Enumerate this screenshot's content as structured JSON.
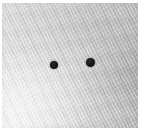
{
  "image": {
    "title": "Photograph of light gray woven fabric with two dark dots",
    "subject": "textured cloth surface",
    "width_px": 144,
    "height_px": 132,
    "orientation": "landscape"
  },
  "surface": {
    "name": "woven fabric",
    "material": "textured cloth",
    "weave_direction": "diagonal, lower-left to upper-right",
    "base_color": "#d6d6d6",
    "light_color": "#ececec",
    "dark_color": "#bababa",
    "lighting": "lighter at bottom-left, darker toward right edge"
  },
  "margins": {
    "top_px": 3,
    "right_px": 6,
    "bottom_px": 4,
    "left_px": 2,
    "color": "#ffffff"
  },
  "markers": [
    {
      "label": "left dot",
      "center_x": 53.5,
      "center_y": 64.5,
      "radius_px": 4.0,
      "color": "#161616",
      "shape": "circle"
    },
    {
      "label": "right dot",
      "center_x": 90.5,
      "center_y": 62.5,
      "radius_px": 4.5,
      "color": "#141414",
      "shape": "circle"
    }
  ]
}
